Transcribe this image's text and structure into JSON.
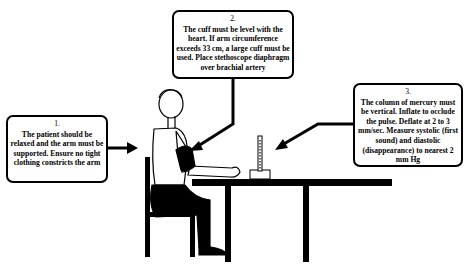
{
  "diagram": {
    "steps": [
      {
        "number": "1.",
        "text": "The patient should be relaxed and the arm must be supported. Ensure no tight clothing constricts the arm",
        "points_to": "patient-torso"
      },
      {
        "number": "2.",
        "text": "The cuff must be level with the heart. If arm circumference exceeds 33 cm, a large cuff must be used. Place stethoscope diaphragm over brachial artery",
        "points_to": "arm-cuff"
      },
      {
        "number": "3.",
        "text": "The column of mercury must be vertical. Inflate to occlude the pulse. Deflate at 2 to 3 mm/sec. Measure systolic (first sound) and diastolic (disappearance) to nearest 2 mm Hg",
        "points_to": "mercury-manometer"
      }
    ],
    "figure_elements": [
      "seated-patient",
      "chair",
      "table",
      "blood-pressure-cuff",
      "mercury-sphygmomanometer"
    ],
    "colors": {
      "line": "#000000",
      "background": "#ffffff"
    }
  }
}
